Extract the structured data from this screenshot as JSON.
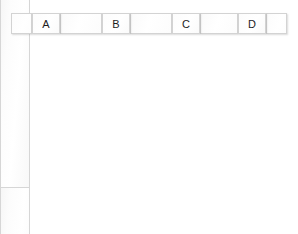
{
  "diagram": {
    "background_color": "#ffffff",
    "fill_color": "#fdfdfd",
    "border_color": "#d3d3d3",
    "label_color": "#1d1d1d",
    "canvas": {
      "width": 298,
      "height": 234
    },
    "header_bar": {
      "top": 13,
      "height": 21
    },
    "leading_cap": {
      "x": 11,
      "y": 13,
      "width": 21,
      "height": 21
    },
    "trailing_cap": {
      "x": 266,
      "y": 13,
      "width": 21,
      "height": 21
    },
    "columns": [
      {
        "label": "A",
        "head": {
          "x": 32,
          "y": 13,
          "width": 28,
          "height": 21
        },
        "prong": {
          "x": 32,
          "y": 34,
          "width": 28,
          "height": 187
        }
      },
      {
        "label": "B",
        "head": {
          "x": 102,
          "y": 13,
          "width": 28,
          "height": 21
        },
        "prong": {
          "x": 102,
          "y": 34,
          "width": 28,
          "height": 187
        }
      },
      {
        "label": "C",
        "head": {
          "x": 172,
          "y": 13,
          "width": 28,
          "height": 21
        },
        "prong": {
          "x": 172,
          "y": 34,
          "width": 28,
          "height": 187
        }
      },
      {
        "label": "D",
        "head": {
          "x": 238,
          "y": 13,
          "width": 28,
          "height": 21
        },
        "prong": {
          "x": 238,
          "y": 34,
          "width": 28,
          "height": 187
        }
      }
    ],
    "spacers": [
      {
        "x": 60,
        "y": 13,
        "width": 42,
        "height": 21
      },
      {
        "x": 130,
        "y": 13,
        "width": 42,
        "height": 21
      },
      {
        "x": 200,
        "y": 13,
        "width": 38,
        "height": 21
      }
    ]
  }
}
